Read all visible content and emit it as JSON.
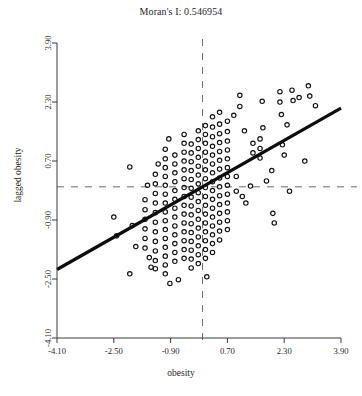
{
  "chart_data": {
    "type": "scatter",
    "title": "Moran's I: 0.546954",
    "xlabel": "obesity",
    "ylabel": "lagged obesity",
    "xlim": [
      -4.1,
      3.9
    ],
    "ylim": [
      -4.1,
      3.9
    ],
    "xticks": [
      "-4.10",
      "-2.50",
      "-0.90",
      "0.70",
      "2.30",
      "3.90"
    ],
    "xtick_values": [
      -4.1,
      -2.5,
      -0.9,
      0.7,
      2.3,
      3.9
    ],
    "yticks": [
      "-4.10",
      "-2.50",
      "-0.90",
      "0.70",
      "2.30",
      "3.90"
    ],
    "ytick_values": [
      -4.1,
      -2.5,
      -0.9,
      0.7,
      2.3,
      3.9
    ],
    "grid": false,
    "legend": "none",
    "marker": "open-circle",
    "marker_size": 4.4,
    "reference_lines": {
      "vertical_dashed_x": 0.0,
      "horizontal_dashed_y": 0.0,
      "dash_color": "#6b6b6b"
    },
    "regression_line": {
      "slope": 0.546954,
      "intercept": 0.0,
      "color": "#0d0d0d",
      "width": 3.2,
      "x_start": -4.1,
      "x_end": 3.9,
      "y_start": -2.242,
      "y_end": 2.133
    },
    "points": [
      [
        -2.5,
        -0.82
      ],
      [
        -2.42,
        -1.33
      ],
      [
        -2.05,
        0.54
      ],
      [
        -1.98,
        -1.05
      ],
      [
        -1.62,
        -0.35
      ],
      [
        -1.62,
        -0.62
      ],
      [
        -1.62,
        -0.88
      ],
      [
        -1.62,
        -1.14
      ],
      [
        -1.62,
        -1.4
      ],
      [
        -1.62,
        -1.66
      ],
      [
        -1.55,
        0.04
      ],
      [
        -1.5,
        -1.92
      ],
      [
        -1.45,
        -2.18
      ],
      [
        -1.33,
        0.34
      ],
      [
        -1.33,
        0.08
      ],
      [
        -1.33,
        -0.18
      ],
      [
        -1.33,
        -0.44
      ],
      [
        -1.33,
        -0.7
      ],
      [
        -1.33,
        -0.96
      ],
      [
        -1.33,
        -1.22
      ],
      [
        -1.33,
        -1.48
      ],
      [
        -1.33,
        -1.74
      ],
      [
        -1.33,
        -2.0
      ],
      [
        -1.33,
        -2.22
      ],
      [
        -1.25,
        0.62
      ],
      [
        -1.05,
        1.02
      ],
      [
        -1.05,
        0.76
      ],
      [
        -1.05,
        0.52
      ],
      [
        -1.05,
        0.28
      ],
      [
        -1.05,
        0.04
      ],
      [
        -1.05,
        -0.2
      ],
      [
        -1.05,
        -0.44
      ],
      [
        -1.05,
        -0.68
      ],
      [
        -1.05,
        -0.92
      ],
      [
        -1.05,
        -1.16
      ],
      [
        -1.05,
        -1.4
      ],
      [
        -1.05,
        -1.64
      ],
      [
        -1.05,
        -1.88
      ],
      [
        -1.05,
        -2.12
      ],
      [
        -1.05,
        -2.36
      ],
      [
        -0.95,
        1.3
      ],
      [
        -0.92,
        -2.62
      ],
      [
        -0.78,
        0.86
      ],
      [
        -0.78,
        0.62
      ],
      [
        -0.78,
        0.38
      ],
      [
        -0.78,
        0.14
      ],
      [
        -0.78,
        -0.1
      ],
      [
        -0.78,
        -0.34
      ],
      [
        -0.78,
        -0.58
      ],
      [
        -0.78,
        -0.82
      ],
      [
        -0.78,
        -1.06
      ],
      [
        -0.78,
        -1.3
      ],
      [
        -0.78,
        -1.54
      ],
      [
        -0.78,
        -1.78
      ],
      [
        -0.78,
        -2.02
      ],
      [
        -0.52,
        1.42
      ],
      [
        -0.52,
        1.18
      ],
      [
        -0.52,
        0.94
      ],
      [
        -0.52,
        0.7
      ],
      [
        -0.52,
        0.46
      ],
      [
        -0.52,
        0.22
      ],
      [
        -0.52,
        -0.02
      ],
      [
        -0.52,
        -0.26
      ],
      [
        -0.52,
        -0.5
      ],
      [
        -0.52,
        -0.74
      ],
      [
        -0.52,
        -0.98
      ],
      [
        -0.52,
        -1.22
      ],
      [
        -0.52,
        -1.46
      ],
      [
        -0.52,
        -1.7
      ],
      [
        -0.52,
        -1.94
      ],
      [
        -0.32,
        1.16
      ],
      [
        -0.32,
        0.92
      ],
      [
        -0.32,
        0.68
      ],
      [
        -0.32,
        0.44
      ],
      [
        -0.32,
        0.2
      ],
      [
        -0.32,
        -0.04
      ],
      [
        -0.32,
        -0.28
      ],
      [
        -0.32,
        -0.52
      ],
      [
        -0.32,
        -0.76
      ],
      [
        -0.32,
        -1.0
      ],
      [
        -0.32,
        -1.24
      ],
      [
        -0.32,
        -1.48
      ],
      [
        -0.32,
        -1.72
      ],
      [
        -0.32,
        -1.96
      ],
      [
        -0.32,
        -2.2
      ],
      [
        -0.12,
        1.52
      ],
      [
        -0.12,
        1.28
      ],
      [
        -0.12,
        1.04
      ],
      [
        -0.12,
        0.8
      ],
      [
        -0.12,
        0.56
      ],
      [
        -0.12,
        0.32
      ],
      [
        -0.12,
        0.08
      ],
      [
        -0.12,
        -0.16
      ],
      [
        -0.12,
        -0.4
      ],
      [
        -0.12,
        -0.64
      ],
      [
        -0.12,
        -0.88
      ],
      [
        -0.12,
        -1.12
      ],
      [
        -0.12,
        -1.36
      ],
      [
        -0.12,
        -1.6
      ],
      [
        -0.12,
        -1.84
      ],
      [
        -0.12,
        -2.08
      ],
      [
        0.08,
        1.66
      ],
      [
        0.08,
        1.42
      ],
      [
        0.08,
        1.18
      ],
      [
        0.08,
        0.94
      ],
      [
        0.08,
        0.7
      ],
      [
        0.08,
        0.46
      ],
      [
        0.08,
        0.22
      ],
      [
        0.08,
        -0.02
      ],
      [
        0.08,
        -0.26
      ],
      [
        0.08,
        -0.5
      ],
      [
        0.08,
        -0.74
      ],
      [
        0.08,
        -0.98
      ],
      [
        0.08,
        -1.22
      ],
      [
        0.08,
        -1.46
      ],
      [
        0.08,
        -1.7
      ],
      [
        0.08,
        -1.94
      ],
      [
        0.28,
        1.9
      ],
      [
        0.28,
        1.62
      ],
      [
        0.28,
        1.36
      ],
      [
        0.28,
        1.1
      ],
      [
        0.28,
        0.86
      ],
      [
        0.28,
        0.62
      ],
      [
        0.28,
        0.38
      ],
      [
        0.28,
        0.14
      ],
      [
        0.28,
        -0.1
      ],
      [
        0.28,
        -0.34
      ],
      [
        0.28,
        -0.58
      ],
      [
        0.28,
        -0.82
      ],
      [
        0.28,
        -1.06
      ],
      [
        0.28,
        -1.3
      ],
      [
        0.28,
        -1.54
      ],
      [
        0.28,
        -1.78
      ],
      [
        0.48,
        2.02
      ],
      [
        0.48,
        1.7
      ],
      [
        0.48,
        1.44
      ],
      [
        0.48,
        1.2
      ],
      [
        0.48,
        0.96
      ],
      [
        0.48,
        0.72
      ],
      [
        0.48,
        0.48
      ],
      [
        0.48,
        0.24
      ],
      [
        0.48,
        0.0
      ],
      [
        0.48,
        -0.24
      ],
      [
        0.48,
        -0.48
      ],
      [
        0.48,
        -0.72
      ],
      [
        0.48,
        -0.96
      ],
      [
        0.48,
        -1.2
      ],
      [
        0.48,
        -1.44
      ],
      [
        0.7,
        1.78
      ],
      [
        0.7,
        1.5
      ],
      [
        0.7,
        1.24
      ],
      [
        0.7,
        1.0
      ],
      [
        0.7,
        0.76
      ],
      [
        0.7,
        0.52
      ],
      [
        0.7,
        0.28
      ],
      [
        0.7,
        0.04
      ],
      [
        0.7,
        -0.2
      ],
      [
        0.7,
        -0.44
      ],
      [
        0.7,
        -0.68
      ],
      [
        0.7,
        -0.92
      ],
      [
        0.7,
        -1.16
      ],
      [
        0.95,
        0.28
      ],
      [
        0.95,
        -0.12
      ],
      [
        1.22,
        -0.44
      ],
      [
        1.05,
        2.48
      ],
      [
        1.05,
        2.18
      ],
      [
        1.42,
        1.18
      ],
      [
        1.42,
        0.92
      ],
      [
        1.62,
        1.3
      ],
      [
        1.62,
        1.04
      ],
      [
        1.62,
        0.78
      ],
      [
        1.68,
        2.32
      ],
      [
        1.7,
        1.6
      ],
      [
        1.95,
        0.44
      ],
      [
        1.98,
        -0.72
      ],
      [
        2.02,
        -0.98
      ],
      [
        2.18,
        2.58
      ],
      [
        2.18,
        2.3
      ],
      [
        2.22,
        1.96
      ],
      [
        2.25,
        1.14
      ],
      [
        2.3,
        0.86
      ],
      [
        2.38,
        1.68
      ],
      [
        2.52,
        2.62
      ],
      [
        2.55,
        2.34
      ],
      [
        2.72,
        2.42
      ],
      [
        2.98,
        2.74
      ],
      [
        3.02,
        2.46
      ],
      [
        3.18,
        2.2
      ],
      [
        2.88,
        0.7
      ],
      [
        2.45,
        -0.12
      ],
      [
        -2.05,
        -2.36
      ],
      [
        -1.88,
        -1.62
      ],
      [
        0.12,
        -2.44
      ],
      [
        -0.68,
        -2.52
      ],
      [
        1.8,
        0.16
      ],
      [
        1.35,
        0.02
      ],
      [
        1.12,
        -0.26
      ],
      [
        0.88,
        1.94
      ],
      [
        1.18,
        1.52
      ]
    ]
  }
}
